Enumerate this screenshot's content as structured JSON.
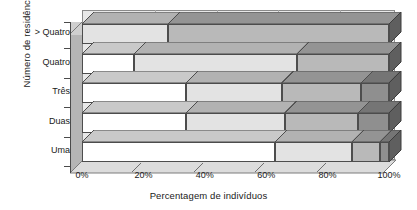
{
  "chart_data": {
    "type": "bar",
    "orientation": "horizontal",
    "stacked": true,
    "normalized_percent": true,
    "title": "",
    "xlabel": "Percentagem de indivíduos",
    "ylabel": "Número de residências",
    "xlim": [
      0,
      100
    ],
    "xticks": [
      "0%",
      "20%",
      "40%",
      "60%",
      "80%",
      "100%"
    ],
    "xtick_values": [
      0,
      20,
      40,
      60,
      80,
      100
    ],
    "grid": true,
    "legend": "none",
    "categories": [
      "> Quatro",
      "Quatro",
      "Três",
      "Duas",
      "Uma"
    ],
    "series": [
      {
        "name": "Segmento 1",
        "color": "#ffffff",
        "values": [
          0,
          17,
          34,
          34,
          63
        ]
      },
      {
        "name": "Segmento 2",
        "color": "#e3e3e3",
        "values": [
          28,
          53,
          31,
          32,
          25
        ]
      },
      {
        "name": "Segmento 3",
        "color": "#b9b9b9",
        "values": [
          72,
          30,
          26,
          24,
          9
        ]
      },
      {
        "name": "Segmento 4",
        "color": "#8f8f8f",
        "values": [
          0,
          0,
          9,
          10,
          3
        ]
      }
    ],
    "bars": [
      {
        "category": "> Quatro",
        "boundaries": [
          0,
          28,
          100,
          100,
          100
        ]
      },
      {
        "category": "Quatro",
        "boundaries": [
          17,
          70,
          100,
          100,
          100
        ]
      },
      {
        "category": "Três",
        "boundaries": [
          34,
          65,
          91,
          100,
          100
        ]
      },
      {
        "category": "Duas",
        "boundaries": [
          34,
          66,
          90,
          100,
          100
        ]
      },
      {
        "category": "Uma",
        "boundaries": [
          63,
          88,
          97,
          100,
          100
        ]
      }
    ]
  },
  "axes": {
    "y_title": "Número de residências",
    "x_title": "Percentagem de indivíduos",
    "categories": [
      "> Quatro",
      "Quatro",
      "Três",
      "Duas",
      "Uma"
    ],
    "xticks": [
      "0%",
      "20%",
      "40%",
      "60%",
      "80%",
      "100%"
    ]
  },
  "colors": {
    "plot_background": "#e8e8e8",
    "grid": "#a8a8a8",
    "axis": "#4a4a4a",
    "side_wall": "#b5b5b5",
    "floor": "#dcdcdc",
    "bar_outline": "#4d4d4d",
    "segment_fills": [
      "#ffffff",
      "#e3e3e3",
      "#b9b9b9",
      "#8f8f8f"
    ],
    "segment_tops": [
      "#c9c9c9",
      "#b2b2b2",
      "#949494",
      "#757575"
    ],
    "text": "#1a1a1a"
  }
}
